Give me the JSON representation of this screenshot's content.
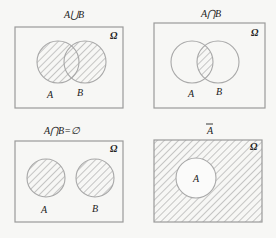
{
  "figure": {
    "colors": {
      "background": "#f7f7f5",
      "frame": "#9a9a9a",
      "circle": "#a8a8a8",
      "hatch": "#9c9c9c",
      "text": "#222222"
    },
    "universe_symbol": "Ω",
    "panels": [
      {
        "id": "union",
        "title": "A⋃B",
        "universe_label": "Ω",
        "sets": [
          {
            "label": "A",
            "shaded": true
          },
          {
            "label": "B",
            "shaded": true
          }
        ],
        "shaded_region": "A union B"
      },
      {
        "id": "intersection",
        "title": "A⋂B",
        "universe_label": "Ω",
        "sets": [
          {
            "label": "A",
            "shaded": false
          },
          {
            "label": "B",
            "shaded": false
          }
        ],
        "shaded_region": "A intersect B"
      },
      {
        "id": "disjoint",
        "title": "A⋂B=∅",
        "universe_label": "Ω",
        "sets": [
          {
            "label": "A",
            "shaded": true
          },
          {
            "label": "B",
            "shaded": true
          }
        ],
        "shaded_region": "A and B (disjoint)"
      },
      {
        "id": "complement",
        "title": "A",
        "title_overbar": true,
        "universe_label": "Ω",
        "sets": [
          {
            "label": "A",
            "shaded": false
          }
        ],
        "shaded_region": "complement of A"
      }
    ]
  }
}
